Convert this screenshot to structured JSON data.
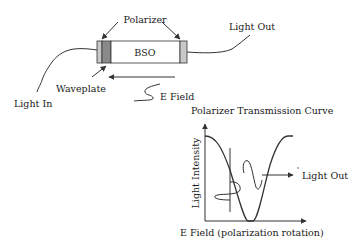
{
  "device": {
    "crystal_label": "BSO",
    "polarizer_label": "Polarizer",
    "waveplate_label": "Waveplate",
    "light_in_label": "Light In",
    "light_out_label": "Light Out",
    "efield_label": "E Field"
  },
  "curve": {
    "title": "Polarizer Transmission Curve",
    "ylabel": "Light Intensity",
    "xlabel": "E Field (polarization rotation)",
    "output_label": "Light Out"
  },
  "colors": {
    "polarizer": "#c8c8c8",
    "waveplate": "#8a8a8a",
    "crystal": "#ffffff",
    "stroke": "#333333"
  }
}
